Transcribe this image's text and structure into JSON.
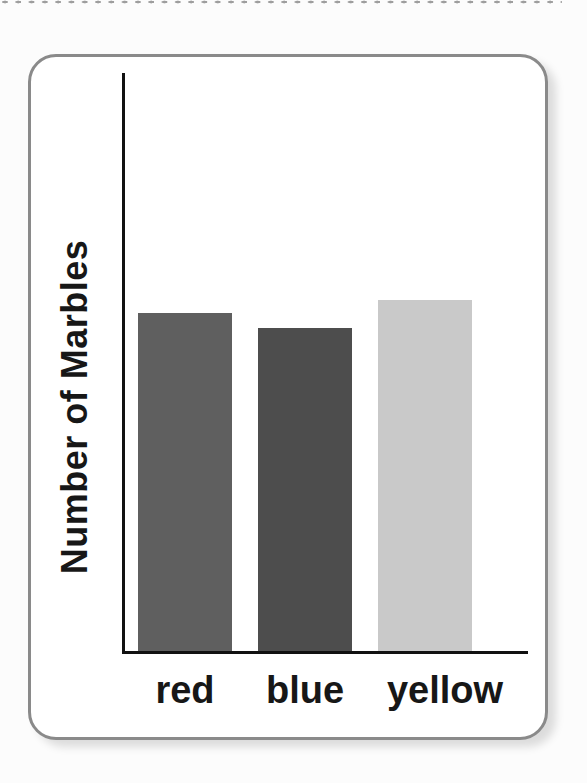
{
  "page": {
    "background_color": "#fcfcfc",
    "edge_dots_color": "#9e9e9e"
  },
  "card": {
    "background_color": "#ffffff",
    "border_color": "#8a8a8a"
  },
  "chart_data": {
    "type": "bar",
    "title": "",
    "ylabel": "Number of Marbles",
    "xlabel": "",
    "categories": [
      "red",
      "blue",
      "yellow"
    ],
    "values_normalized": [
      0.58,
      0.56,
      0.61
    ],
    "bar_heights_px": [
      338,
      323,
      351
    ],
    "bar_colors": [
      "#5f5f5f",
      "#4d4d4d",
      "#c9c9c9"
    ],
    "axis_color": "#111111",
    "label_color": "#171717",
    "gridlines": false,
    "legend": false,
    "y_tick_labels": [],
    "x_tick_labels": [
      "red",
      "blue",
      "yellow"
    ],
    "note": "grayscale scan; no numeric scale shown on axis",
    "layout": {
      "baseline_y": 594,
      "first_bar_left": 107,
      "bar_pitch": 120,
      "bar_width": 94,
      "label_row_top": 612,
      "label_center_offsets": [
        0,
        0,
        20
      ]
    }
  }
}
